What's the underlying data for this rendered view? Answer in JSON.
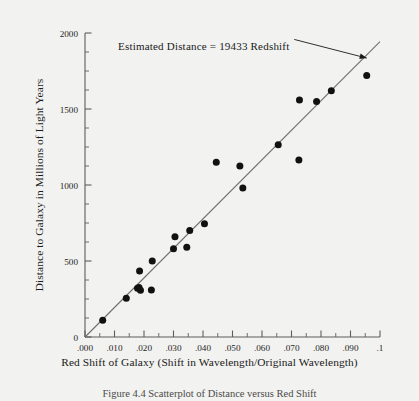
{
  "figure": {
    "background_color": "#f2f2f0",
    "caption": "Figure 4.4   Scatterplot of Distance versus Red Shift"
  },
  "annotation": {
    "text": "Estimated Distance  =  19433 Redshift",
    "arrow_from_x": 0.0845,
    "arrow_from_y": 1905,
    "arrow_to_x": 0.0955,
    "arrow_to_y": 1835
  },
  "chart_data": {
    "type": "scatter",
    "title": "",
    "xlabel": "Red Shift of Galaxy (Shift in Wavelength/Original Wavelength)",
    "ylabel": "Distance to Galaxy in Millions of Light Years",
    "xlim": [
      0.0,
      0.1
    ],
    "ylim": [
      0,
      2000
    ],
    "grid": false,
    "legend": "none",
    "xticks": [
      0.0,
      0.01,
      0.02,
      0.03,
      0.04,
      0.05,
      0.06,
      0.07,
      0.08,
      0.09,
      0.1
    ],
    "xticklabels": [
      ".000",
      ".010",
      ".020",
      ".030",
      ".040",
      ".050",
      ".060",
      ".070",
      ".080",
      ".090",
      ".1"
    ],
    "yticks": [
      0,
      500,
      1000,
      1500,
      2000
    ],
    "yticklabels": [
      "0",
      "500",
      "1000",
      "1500",
      "2000"
    ],
    "x_minor_tick_step": 0.005,
    "y_minor_tick_step": 125,
    "marker_color": "#111111",
    "marker_size": 4.6,
    "line_color": "#6f6f6f",
    "series": [
      {
        "name": "Galaxies",
        "x": [
          0.006,
          0.014,
          0.0178,
          0.0183,
          0.0188,
          0.0185,
          0.0225,
          0.0228,
          0.03,
          0.0305,
          0.0345,
          0.0355,
          0.0405,
          0.0445,
          0.0525,
          0.0535,
          0.0655,
          0.0725,
          0.0727,
          0.0785,
          0.0835,
          0.0955
        ],
        "y": [
          110,
          255,
          320,
          325,
          308,
          435,
          310,
          500,
          580,
          660,
          590,
          700,
          745,
          1150,
          1125,
          980,
          1265,
          1165,
          1560,
          1550,
          1620,
          1720
        ]
      }
    ],
    "fit_line": {
      "name": "Estimated Distance = 19433 Redshift",
      "slope": 19433,
      "intercept": 0,
      "x_start": 0.0,
      "x_end": 0.1
    }
  }
}
